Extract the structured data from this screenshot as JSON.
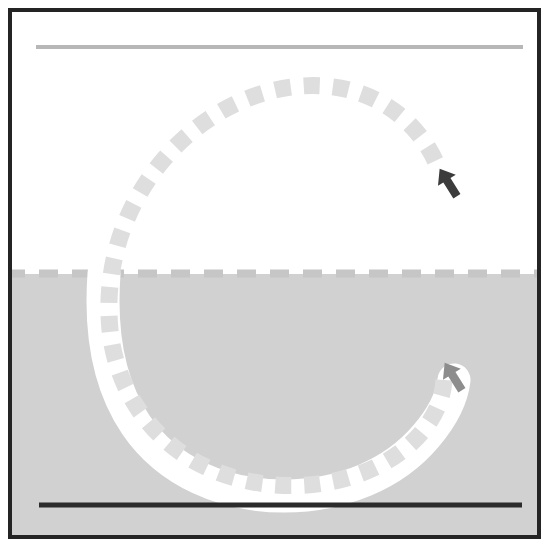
{
  "scene": {
    "title": "Vehicle trajectory plot",
    "frame": {
      "border_color": "#242424",
      "border_width_px": 4,
      "x": 8,
      "y": 8,
      "width": 533,
      "height": 531
    },
    "regions": [
      {
        "name": "upper-region",
        "label": "free space",
        "fill": "#ffffff",
        "x": 0,
        "y": 0,
        "width": 525,
        "height": 261
      },
      {
        "name": "lower-region",
        "label": "drivable area",
        "fill": "#d1d1d1",
        "x": 0,
        "y": 261,
        "width": 525,
        "height": 262
      }
    ],
    "lane_lines": [
      {
        "name": "upper-lane-boundary",
        "style": "solid",
        "color": "#b9b9b9",
        "thickness_px": 4,
        "x1": 24,
        "y1": 35,
        "x2": 510,
        "y2": 35
      },
      {
        "name": "center-lane-divider",
        "style": "dashed",
        "color": "#c4c4c4",
        "thickness_px": 7,
        "dash_px": 18,
        "gap_px": 14,
        "x1": 0,
        "y1": 262,
        "x2": 525,
        "y2": 262
      },
      {
        "name": "lower-lane-boundary",
        "style": "solid",
        "color": "#2b2b2b",
        "thickness_px": 5,
        "x1": 27,
        "y1": 493,
        "x2": 509,
        "y2": 493
      }
    ],
    "paths": [
      {
        "name": "executed-path-corridor",
        "role": "driven corridor",
        "style": "solid",
        "color": "#ffffff",
        "thickness_px": 32,
        "linecap": "round",
        "geometry": "C-shaped arc, clockwise from upper-left boundary sweeping down and around to lower-right"
      },
      {
        "name": "planned-path-centerline",
        "role": "reference trajectory",
        "style": "dashed",
        "color": "#dedede",
        "thickness_px": 17,
        "dash_px": 16,
        "gap_px": 13,
        "geometry": "near-circular spiral arc centered mid-frame, from lower-right end marker counter-clockwise up over the top and down to the lower-right goal marker"
      }
    ],
    "markers": [
      {
        "name": "start-pose-arrow",
        "label": "start pose",
        "color": "#3a3a3a",
        "x": 435,
        "y": 170,
        "heading_deg": -35,
        "on_region": "upper-region"
      },
      {
        "name": "goal-pose-arrow",
        "label": "goal pose",
        "color": "#8a8a8a",
        "x": 443,
        "y": 364,
        "heading_deg": -30,
        "on_region": "lower-region"
      }
    ]
  }
}
